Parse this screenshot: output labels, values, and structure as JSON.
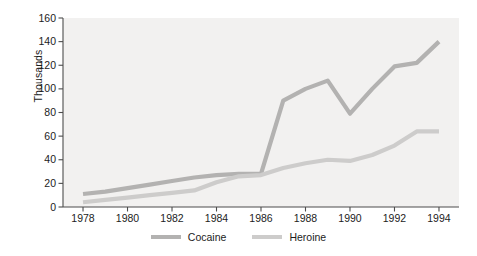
{
  "chart_data": {
    "type": "line",
    "title": "",
    "subtitle": "",
    "xlabel": "",
    "ylabel": "Thousands",
    "x": [
      1978,
      1979,
      1980,
      1981,
      1982,
      1983,
      1984,
      1985,
      1986,
      1987,
      1988,
      1989,
      1990,
      1991,
      1992,
      1993,
      1994
    ],
    "xtick_labels": [
      "1978",
      "1980",
      "1982",
      "1984",
      "1986",
      "1988",
      "1990",
      "1992",
      "1994"
    ],
    "xticks": [
      1978,
      1980,
      1982,
      1984,
      1986,
      1988,
      1990,
      1992,
      1994
    ],
    "ytick_labels": [
      "0",
      "20",
      "40",
      "60",
      "80",
      "100",
      "120",
      "140",
      "160"
    ],
    "yticks": [
      0,
      20,
      40,
      60,
      80,
      100,
      120,
      140,
      160
    ],
    "xlim": [
      1977.1,
      1994.9
    ],
    "ylim": [
      0,
      160
    ],
    "grid": false,
    "legend_position": "bottom-center",
    "series": [
      {
        "name": "Cocaine",
        "color": "#b3b2b1",
        "values": [
          11,
          13,
          16,
          19,
          22,
          25,
          27,
          28,
          28,
          90,
          100,
          107,
          79,
          100,
          119,
          122,
          140
        ]
      },
      {
        "name": "Heroine",
        "color": "#cdcccb",
        "values": [
          4,
          6,
          8,
          10,
          12,
          14,
          21,
          26,
          27,
          33,
          37,
          40,
          39,
          44,
          52,
          64,
          64
        ]
      }
    ]
  },
  "legend": {
    "entries": [
      {
        "label": "Cocaine"
      },
      {
        "label": "Heroine"
      }
    ]
  },
  "colors": {
    "plot_background": "#f2f1f0",
    "page_background": "#ffffff",
    "axis": "#4d4d4d",
    "text": "#1c1c1c",
    "cocaine": "#b3b2b1",
    "heroine": "#cdcccb"
  }
}
